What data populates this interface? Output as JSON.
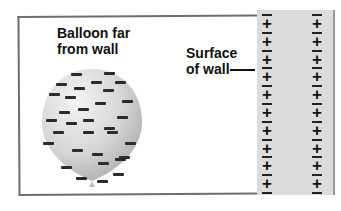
{
  "labels": {
    "balloon": [
      "Balloon far",
      "from wall"
    ],
    "wall": [
      "Surface",
      "of wall"
    ]
  },
  "wall": {
    "fill_color": "#dcdcdc",
    "charge_columns": 2,
    "plus_count_per_column": 10,
    "minus_count_per_column": 11,
    "pattern": "alternating minus/plus, starting and ending with minus"
  },
  "balloon": {
    "fill_gradient": [
      "#f4f4f4",
      "#b9b9b9"
    ],
    "charge_sign": "negative",
    "dash_count": 32
  },
  "colors": {
    "frame": "#6e6e6e",
    "text": "#111111"
  }
}
